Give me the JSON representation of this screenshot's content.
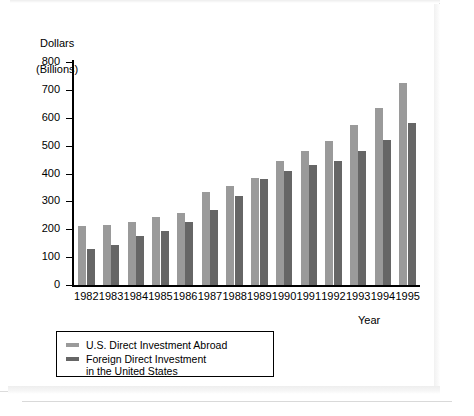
{
  "chart_data": {
    "type": "bar",
    "title": "",
    "ylabel": "Dollars\n(Billions)",
    "xlabel": "Year",
    "ylim": [
      0,
      800
    ],
    "ytick_step": 100,
    "yticks": [
      "800",
      "700",
      "600",
      "500",
      "400",
      "300",
      "200",
      "100",
      "0"
    ],
    "grid": false,
    "legend_position": "below-left",
    "categories": [
      "1982",
      "1983",
      "1984",
      "1985",
      "1986",
      "1987",
      "1988",
      "1989",
      "1990",
      "1991",
      "1992",
      "1993",
      "1994",
      "1995"
    ],
    "series": [
      {
        "name": "U.S. Direct Investment Abroad",
        "color": "#9a9a9a",
        "values": [
          210,
          215,
          225,
          245,
          260,
          335,
          355,
          385,
          445,
          480,
          515,
          575,
          635,
          725
        ]
      },
      {
        "name": "Foreign Direct Investment in the United States",
        "color": "#666666",
        "values": [
          130,
          145,
          175,
          195,
          225,
          270,
          320,
          380,
          410,
          430,
          445,
          480,
          520,
          580
        ]
      }
    ]
  },
  "axis": {
    "y_title_line1": "Dollars",
    "y_title_line2": "(Billions)",
    "x_title": "Year"
  },
  "legend": {
    "items": [
      {
        "label": "U.S. Direct Investment Abroad",
        "color": "#9a9a9a"
      },
      {
        "label": "Foreign Direct Investment\nin the United States",
        "color": "#666666"
      }
    ]
  },
  "colors": {
    "series_light": "#9a9a9a",
    "series_dark": "#666666",
    "axis": "#000000",
    "background": "#ffffff"
  }
}
